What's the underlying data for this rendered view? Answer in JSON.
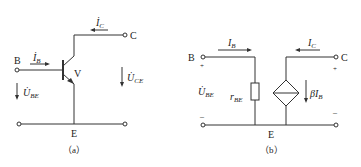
{
  "figure_a": {
    "caption": "（a）",
    "terminal_b": "B",
    "terminal_c": "C",
    "terminal_e": "E",
    "transistor_label": "V",
    "current_b": {
      "symbol": "İ",
      "sub": "B"
    },
    "current_c": {
      "symbol": "İ",
      "sub": "C"
    },
    "voltage_be": {
      "symbol": "U̇",
      "sub": "BE"
    },
    "voltage_ce": {
      "symbol": "U̇",
      "sub": "CE"
    }
  },
  "figure_b": {
    "caption": "（b）",
    "terminal_b": "B",
    "terminal_c": "C",
    "terminal_e": "E",
    "current_b": {
      "symbol": "I",
      "sub": "B"
    },
    "current_c": {
      "symbol": "I",
      "sub": "C"
    },
    "voltage_be": {
      "symbol": "U̇",
      "sub": "BE"
    },
    "resistor": {
      "symbol": "r",
      "sub": "BE"
    },
    "source": {
      "symbol": "βI",
      "sub": "B"
    },
    "plus": "+",
    "minus": "–"
  }
}
